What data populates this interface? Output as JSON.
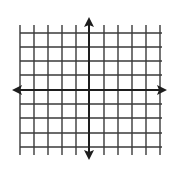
{
  "diagram": {
    "type": "coordinate-plane",
    "colors": {
      "background": "#ffffff",
      "grid": "#3a3a3a",
      "axis": "#1e1e1e"
    },
    "grid": {
      "vertical_lines_x": [
        20,
        34,
        48,
        62,
        76,
        104,
        118,
        132,
        146,
        160
      ],
      "horizontal_lines_y": [
        33,
        47,
        61,
        75,
        104,
        118,
        133,
        147
      ],
      "extent": {
        "x_min": 20,
        "x_max": 162,
        "y_min": 25,
        "y_max": 155
      }
    },
    "axes": {
      "x_axis": {
        "y": 90,
        "x_start": 12,
        "x_end": 167,
        "arrows": [
          "left",
          "right"
        ]
      },
      "y_axis": {
        "x": 89,
        "y_start": 17,
        "y_end": 160,
        "arrows": [
          "up",
          "down"
        ]
      }
    },
    "labels": []
  }
}
